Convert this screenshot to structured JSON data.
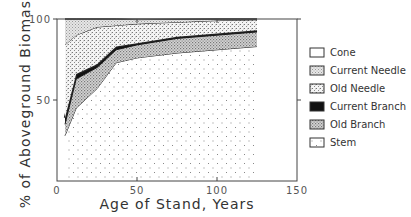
{
  "chart_data": {
    "type": "area",
    "stacked": true,
    "title": "",
    "xlabel": "Age of Stand, Years",
    "ylabel": "% of Aboveground Biomass",
    "xlim": [
      0,
      150
    ],
    "ylim": [
      0,
      100
    ],
    "xticks": [
      0,
      50,
      100,
      150
    ],
    "yticks": [
      50,
      100
    ],
    "xtick_labels": [
      "0",
      "50",
      "100",
      "150"
    ],
    "ytick_labels": [
      "50",
      "100"
    ],
    "grid": false,
    "legend_position": "right",
    "x": [
      5,
      12,
      25,
      37,
      50,
      75,
      100,
      125
    ],
    "cumulative_tops": {
      "Stem": [
        28,
        45,
        57,
        73,
        76,
        79,
        81,
        83
      ],
      "Old Branch": [
        35,
        63,
        70,
        81,
        84,
        88,
        90,
        92
      ],
      "Current Branch": [
        39,
        66,
        72,
        83,
        85,
        89,
        91,
        93
      ],
      "Old Needle": [
        84,
        90,
        95,
        96,
        97,
        98,
        99,
        99.5
      ],
      "Current Needle": [
        100,
        100,
        100,
        100,
        99.6,
        99.8,
        100,
        100
      ],
      "Cone": [
        100,
        100,
        100,
        100,
        100,
        100,
        100,
        100
      ]
    },
    "series": [
      {
        "name": "Stem",
        "values": [
          28,
          45,
          57,
          73,
          76,
          79,
          81,
          83
        ]
      },
      {
        "name": "Old Branch",
        "values": [
          7,
          18,
          13,
          8,
          8,
          9,
          9,
          9
        ]
      },
      {
        "name": "Current Branch",
        "values": [
          4,
          3,
          2,
          2,
          1,
          1,
          1,
          1
        ]
      },
      {
        "name": "Old Needle",
        "values": [
          45,
          24,
          23,
          13,
          12,
          9,
          8,
          6.5
        ]
      },
      {
        "name": "Current Needle",
        "values": [
          16,
          10,
          5,
          4,
          2.6,
          1.8,
          1,
          0.5
        ]
      },
      {
        "name": "Cone",
        "values": [
          0,
          0,
          0,
          0,
          0.4,
          0.2,
          0,
          0
        ]
      }
    ]
  },
  "legend": {
    "items": [
      {
        "label": "Cone",
        "pattern": "blank"
      },
      {
        "label": "Current Needle",
        "pattern": "fine-gray"
      },
      {
        "label": "Old Needle",
        "pattern": "fine-dots"
      },
      {
        "label": "Current Branch",
        "pattern": "solid-black"
      },
      {
        "label": "Old Branch",
        "pattern": "coarse-dots"
      },
      {
        "label": "Stem",
        "pattern": "plus-dots"
      }
    ]
  },
  "colors": {
    "ink": "#222222",
    "axis": "#555555",
    "background": "#ffffff"
  }
}
